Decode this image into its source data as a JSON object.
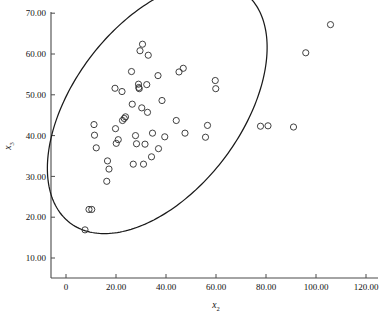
{
  "chart_data": {
    "type": "scatter",
    "title": "",
    "xlabel": "x2",
    "ylabel": "x3",
    "xlabel_base": "x",
    "xlabel_sub": "2",
    "ylabel_base": "x",
    "ylabel_sub": "3",
    "xlim": [
      0,
      120
    ],
    "ylim": [
      5,
      72
    ],
    "grid": false,
    "legend": null,
    "xticks": [
      0,
      20,
      40,
      60,
      80,
      100,
      120
    ],
    "xtick_labels": [
      "0",
      "20.00",
      "40.00",
      "60.00",
      "80.00",
      "100.00",
      "120.00"
    ],
    "yticks": [
      10,
      20,
      30,
      40,
      50,
      60,
      70
    ],
    "ytick_labels": [
      "10.00",
      "20.00",
      "30.00",
      "40.00",
      "50.00",
      "60.00",
      "70.00"
    ],
    "marker": "open-circle",
    "marker_size": 3.1,
    "series": [
      {
        "name": "observations",
        "points": [
          [
            7.6,
            16.9
          ],
          [
            9.2,
            21.9
          ],
          [
            10.3,
            21.9
          ],
          [
            11.2,
            42.7
          ],
          [
            11.4,
            40.1
          ],
          [
            12.1,
            37.0
          ],
          [
            16.3,
            28.8
          ],
          [
            16.6,
            33.8
          ],
          [
            17.2,
            31.8
          ],
          [
            19.6,
            51.6
          ],
          [
            19.8,
            41.7
          ],
          [
            20.1,
            38.1
          ],
          [
            20.9,
            39.0
          ],
          [
            22.4,
            50.8
          ],
          [
            22.6,
            43.7
          ],
          [
            23.3,
            44.2
          ],
          [
            23.8,
            44.6
          ],
          [
            26.2,
            55.7
          ],
          [
            26.5,
            47.7
          ],
          [
            26.9,
            33.0
          ],
          [
            27.8,
            40.0
          ],
          [
            28.2,
            38.0
          ],
          [
            29.0,
            52.6
          ],
          [
            29.1,
            51.8
          ],
          [
            29.3,
            51.5
          ],
          [
            29.6,
            60.8
          ],
          [
            30.3,
            46.8
          ],
          [
            30.6,
            62.4
          ],
          [
            31.0,
            33.0
          ],
          [
            31.6,
            37.9
          ],
          [
            32.3,
            52.5
          ],
          [
            32.6,
            45.7
          ],
          [
            32.9,
            59.7
          ],
          [
            34.2,
            34.8
          ],
          [
            34.6,
            40.6
          ],
          [
            36.8,
            54.7
          ],
          [
            37.0,
            36.8
          ],
          [
            38.4,
            48.6
          ],
          [
            39.5,
            39.7
          ],
          [
            44.1,
            43.7
          ],
          [
            45.2,
            55.6
          ],
          [
            46.9,
            56.5
          ],
          [
            47.6,
            40.6
          ],
          [
            55.8,
            39.6
          ],
          [
            56.6,
            42.5
          ],
          [
            59.7,
            53.5
          ],
          [
            59.9,
            51.5
          ],
          [
            77.8,
            42.3
          ],
          [
            80.8,
            42.4
          ],
          [
            91.0,
            42.1
          ],
          [
            95.9,
            60.3
          ],
          [
            105.8,
            67.2
          ]
        ]
      }
    ],
    "annotations": [
      {
        "name": "confidence-ellipse",
        "type": "ellipse",
        "center_x": 36.5,
        "center_y": 46.8,
        "semi_major": 47.5,
        "semi_minor": 25.0,
        "rotation_deg": -26.5
      }
    ]
  }
}
